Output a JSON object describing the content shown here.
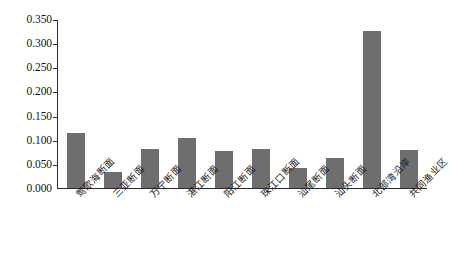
{
  "chart_data": {
    "type": "bar",
    "title": "",
    "subtitle": "",
    "xlabel": "",
    "ylabel": "",
    "ylim": [
      0.0,
      0.35
    ],
    "ytick_labels": [
      "0.350",
      "0.300",
      "0.250",
      "0.200",
      "0.150",
      "0.100",
      "0.050",
      "0.000"
    ],
    "ytick_values": [
      0.35,
      0.3,
      0.25,
      0.2,
      0.15,
      0.1,
      0.05,
      0.0
    ],
    "grid": false,
    "legend": null,
    "bar_color": "#6e6e6e",
    "axis_color": "#2b2b2b",
    "categories": [
      "莺歌海断面",
      "三亚断面",
      "万宁断面",
      "湛江断面",
      "阳江断面",
      "珠江口断面",
      "汕尾断面",
      "汕头断面",
      "北部湾沿岸",
      "共同渔业区"
    ],
    "values": [
      0.115,
      0.033,
      0.082,
      0.105,
      0.077,
      0.082,
      0.042,
      0.062,
      0.328,
      0.08
    ]
  }
}
